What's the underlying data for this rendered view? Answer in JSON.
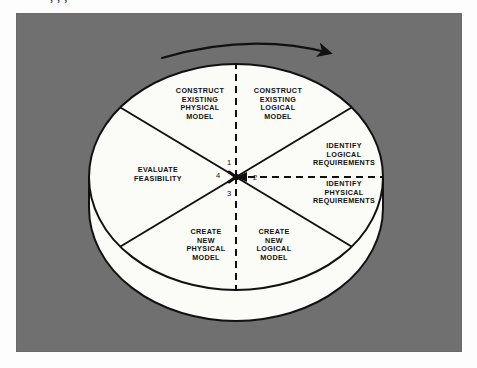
{
  "page": {
    "background_color": "#fdfdfd",
    "panel_color": "#707070",
    "disk_color": "#fbfbf8",
    "line_color": "#111111",
    "top_cropped_text": "        ,      ,     ,"
  },
  "diagram": {
    "type": "cylinder-pie-cycle",
    "title": "",
    "direction_arrow": {
      "name": "clockwise-arrow",
      "description": "curved arrow above the disk pointing clockwise to the right"
    },
    "center_numbers": [
      {
        "id": "1",
        "label": "1",
        "position": "top"
      },
      {
        "id": "2",
        "label": "2",
        "position": "right"
      },
      {
        "id": "3",
        "label": "3",
        "position": "bottom"
      },
      {
        "id": "4",
        "label": "4",
        "position": "left"
      }
    ],
    "segments": [
      {
        "id": "construct-existing-physical-model",
        "label": "CONSTRUCT\nEXISTING\nPHYSICAL\nMODEL",
        "x": 200,
        "y": 104
      },
      {
        "id": "construct-existing-logical-model",
        "label": "CONSTRUCT\nEXISTING\nLOGICAL\nMODEL",
        "x": 278,
        "y": 104
      },
      {
        "id": "identify-logical-requirements",
        "label": "IDENTIFY\nLOGICAL\nREQUIREMENTS",
        "x": 344,
        "y": 155
      },
      {
        "id": "identify-physical-requirements",
        "label": "IDENTIFY\nPHYSICAL\nREQUIREMENTS",
        "x": 344,
        "y": 193
      },
      {
        "id": "create-new-logical-model",
        "label": "CREATE\nNEW\nLOGICAL\nMODEL",
        "x": 274,
        "y": 245
      },
      {
        "id": "create-new-physical-model",
        "label": "CREATE\nNEW\nPHYSICAL\nMODEL",
        "x": 206,
        "y": 245
      },
      {
        "id": "evaluate-feasibility",
        "label": "EVALUATE\nFEASIBILITY",
        "x": 158,
        "y": 175
      }
    ]
  }
}
